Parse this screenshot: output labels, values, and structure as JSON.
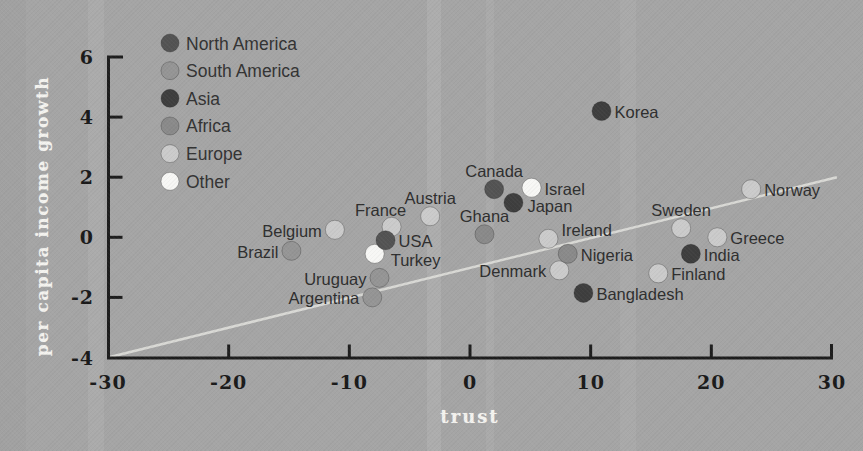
{
  "chart_data": {
    "type": "scatter",
    "title": "",
    "xlabel": "trust",
    "ylabel": "per capita income growth",
    "xlim": [
      -30,
      30
    ],
    "ylim": [
      -4,
      6
    ],
    "x_ticks": [
      -30,
      -20,
      -10,
      0,
      10,
      20,
      30
    ],
    "y_ticks": [
      6,
      4,
      2,
      0,
      -2,
      -4
    ],
    "grid": false,
    "legend_position": "upper-left",
    "background_color": "#a5a5a5",
    "axis_color": "#1d1d1d",
    "trend_color": "#dededa",
    "legend": [
      {
        "label": "North America",
        "color": "#535353"
      },
      {
        "label": "South America",
        "color": "#959595"
      },
      {
        "label": "Asia",
        "color": "#3e3e3e"
      },
      {
        "label": "Africa",
        "color": "#8a8a8a"
      },
      {
        "label": "Europe",
        "color": "#cbcbcb"
      },
      {
        "label": "Other",
        "color": "#f7f7f5"
      }
    ],
    "points": [
      {
        "name": "Belgium",
        "region": "Europe",
        "x": -11.2,
        "y": 0.25,
        "label_pos": "left"
      },
      {
        "name": "France",
        "region": "Europe",
        "x": -6.5,
        "y": 0.35,
        "label_pos": "above-left"
      },
      {
        "name": "Austria",
        "region": "Europe",
        "x": -3.3,
        "y": 0.7,
        "label_pos": "above"
      },
      {
        "name": "Ireland",
        "region": "Europe",
        "x": 6.5,
        "y": -0.05,
        "label_pos": "right-up"
      },
      {
        "name": "Denmark",
        "region": "Europe",
        "x": 7.4,
        "y": -1.1,
        "label_pos": "left"
      },
      {
        "name": "Sweden",
        "region": "Europe",
        "x": 17.5,
        "y": 0.3,
        "label_pos": "above"
      },
      {
        "name": "Norway",
        "region": "Europe",
        "x": 23.3,
        "y": 1.6,
        "label_pos": "right"
      },
      {
        "name": "Greece",
        "region": "Europe",
        "x": 20.5,
        "y": 0.0,
        "label_pos": "right"
      },
      {
        "name": "Finland",
        "region": "Europe",
        "x": 15.6,
        "y": -1.2,
        "label_pos": "right"
      },
      {
        "name": "Ghana",
        "region": "Africa",
        "x": 1.2,
        "y": 0.1,
        "label_pos": "above"
      },
      {
        "name": "Nigeria",
        "region": "Africa",
        "x": 8.1,
        "y": -0.55,
        "label_pos": "right"
      },
      {
        "name": "Brazil",
        "region": "South America",
        "x": -14.8,
        "y": -0.45,
        "label_pos": "left"
      },
      {
        "name": "Uruguay",
        "region": "South America",
        "x": -7.5,
        "y": -1.35,
        "label_pos": "left"
      },
      {
        "name": "Argentina",
        "region": "South America",
        "x": -8.1,
        "y": -2.0,
        "label_pos": "left"
      },
      {
        "name": "Turkey",
        "region": "Other",
        "x": -7.9,
        "y": -0.55,
        "label_pos": "below-right"
      },
      {
        "name": "Israel",
        "region": "Other",
        "x": 5.1,
        "y": 1.65,
        "label_pos": "right"
      },
      {
        "name": "USA",
        "region": "North America",
        "x": -7.0,
        "y": -0.1,
        "label_pos": "right"
      },
      {
        "name": "Canada",
        "region": "North America",
        "x": 2.0,
        "y": 1.6,
        "label_pos": "above"
      },
      {
        "name": "Japan",
        "region": "Asia",
        "x": 3.6,
        "y": 1.15,
        "label_pos": "right-down"
      },
      {
        "name": "Korea",
        "region": "Asia",
        "x": 10.9,
        "y": 4.2,
        "label_pos": "right"
      },
      {
        "name": "India",
        "region": "Asia",
        "x": 18.3,
        "y": -0.55,
        "label_pos": "right"
      },
      {
        "name": "Bangladesh",
        "region": "Asia",
        "x": 9.4,
        "y": -1.85,
        "label_pos": "right"
      }
    ],
    "trend_line": {
      "x1": -30,
      "y1": -4.0,
      "x2": 30.4,
      "y2": 2.0
    }
  }
}
